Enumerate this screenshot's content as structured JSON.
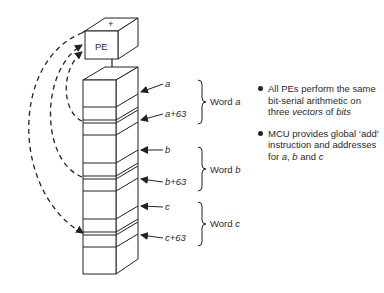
{
  "diagram": {
    "pe_box": {
      "label": "PE",
      "top_symbol": "+"
    },
    "memory_column": {
      "addresses": [
        {
          "label": "a",
          "y": 96
        },
        {
          "label": "a+63",
          "y": 122
        },
        {
          "label": "b",
          "y": 149
        },
        {
          "label": "b+63",
          "y": 181
        },
        {
          "label": "c",
          "y": 206
        },
        {
          "label": "c+63",
          "y": 238
        }
      ],
      "words": [
        {
          "prefix": "Word",
          "var": "a"
        },
        {
          "prefix": "Word",
          "var": "b"
        },
        {
          "prefix": "Word",
          "var": "c"
        }
      ]
    },
    "notes": [
      {
        "text_plain": "All PEs perform the same bit-serial arithmetic on three ",
        "text_italic1": "vectors",
        "text_mid": " of ",
        "text_italic2": "bits"
      },
      {
        "text_plain": "MCU provides global ‘add’ instruction and addresses for ",
        "var_a": "a",
        "sep1": ", ",
        "var_b": "b",
        "sep2": " and ",
        "var_c": "c"
      }
    ],
    "colors": {
      "line": "#222222",
      "background": "#ffffff"
    }
  }
}
